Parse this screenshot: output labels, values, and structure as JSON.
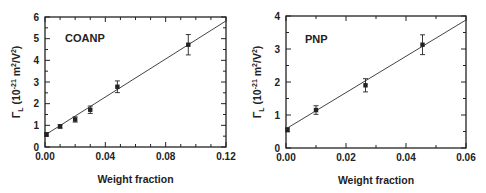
{
  "chart_data": [
    {
      "type": "scatter",
      "panel_label": "COANP",
      "title": "",
      "xlabel": "Weight fraction",
      "ylabel": "Γ_L (10^-21 m²/V²)",
      "ylabel_parts": {
        "symbol": "Γ",
        "sub": "L",
        "pre": " (10",
        "exp": "-21",
        "mid": " m",
        "exp2": "2",
        "post": "/V",
        "exp3": "2",
        "end": ")"
      },
      "xlim": [
        0,
        0.12
      ],
      "ylim": [
        0,
        6
      ],
      "xticks": [
        0.0,
        0.04,
        0.08,
        0.12
      ],
      "xtick_labels": [
        "0.00",
        "0.04",
        "0.08",
        "0.12"
      ],
      "xminor_step": 0.01,
      "yticks": [
        0,
        1,
        2,
        3,
        4,
        5,
        6
      ],
      "ytick_labels": [
        "0",
        "1",
        "2",
        "3",
        "4",
        "5",
        "6"
      ],
      "yminor_step": 0.5,
      "grid": false,
      "legend": "none",
      "series": [
        {
          "name": "data",
          "x": [
            0.001,
            0.01,
            0.02,
            0.03,
            0.048,
            0.095
          ],
          "y": [
            0.58,
            0.95,
            1.27,
            1.72,
            2.78,
            4.72
          ],
          "yerr": [
            0.08,
            0.08,
            0.12,
            0.17,
            0.27,
            0.47
          ]
        },
        {
          "name": "linear fit",
          "x": [
            0.0,
            0.12
          ],
          "y": [
            0.55,
            5.82
          ]
        }
      ]
    },
    {
      "type": "scatter",
      "panel_label": "PNP",
      "title": "",
      "xlabel": "Weight fraction",
      "ylabel": "Γ_L (10^-21 m²/V²)",
      "ylabel_parts": {
        "symbol": "Γ",
        "sub": "L",
        "pre": " (10",
        "exp": "-21",
        "mid": " m",
        "exp2": "2",
        "post": "/V",
        "exp3": "2",
        "end": ")"
      },
      "xlim": [
        0,
        0.06
      ],
      "ylim": [
        0,
        4
      ],
      "xticks": [
        0.0,
        0.02,
        0.04,
        0.06
      ],
      "xtick_labels": [
        "0.00",
        "0.02",
        "0.04",
        "0.06"
      ],
      "xminor_step": 0.01,
      "yticks": [
        0,
        1,
        2,
        3,
        4
      ],
      "ytick_labels": [
        "0",
        "1",
        "2",
        "3",
        "4"
      ],
      "yminor_step": 0.5,
      "grid": false,
      "legend": "none",
      "series": [
        {
          "name": "data",
          "x": [
            0.0005,
            0.01,
            0.0265,
            0.0455
          ],
          "y": [
            0.55,
            1.15,
            1.9,
            3.13
          ],
          "yerr": [
            0.06,
            0.13,
            0.2,
            0.3
          ]
        },
        {
          "name": "linear fit",
          "x": [
            0.0,
            0.06
          ],
          "y": [
            0.58,
            3.88
          ]
        }
      ]
    }
  ],
  "colors": {
    "ink": "#222222",
    "background": "#ffffff"
  }
}
